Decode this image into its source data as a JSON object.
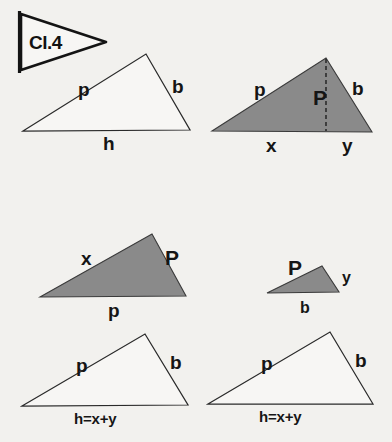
{
  "page": {
    "background_color": "#f2f1ee",
    "width": 392,
    "height": 442
  },
  "flag": {
    "name": "class-flag",
    "label": "Cl.4",
    "pole_color": "#141414",
    "pennant_fill": "#f7f6f4"
  },
  "colors": {
    "ink": "#1a1a1a",
    "shaded_fill": "#8a8a8a",
    "open_fill": "#f7f6f4",
    "paper": "#f2f1ee"
  },
  "figures": [
    {
      "id": "top-left-triangle",
      "name": "triangle-open-top-left",
      "shaded": false,
      "vertices": [
        [
          23,
          131
        ],
        [
          146,
          54
        ],
        [
          190,
          130
        ]
      ],
      "labels": [
        {
          "name": "side-label-p",
          "text": "p",
          "x": 78,
          "y": 96,
          "size": "lbl-lg"
        },
        {
          "name": "side-label-b",
          "text": "b",
          "x": 172,
          "y": 93,
          "size": "lbl-lg"
        },
        {
          "name": "base-label-h",
          "text": "h",
          "x": 103,
          "y": 150,
          "size": "lbl-lg"
        }
      ]
    },
    {
      "id": "top-right-triangle",
      "name": "triangle-shaded-top-right",
      "shaded": true,
      "vertices": [
        [
          212,
          131
        ],
        [
          326,
          58
        ],
        [
          372,
          132
        ]
      ],
      "altitude": {
        "name": "altitude-dashed-line",
        "from": [
          326,
          58
        ],
        "to": [
          326,
          131
        ]
      },
      "labels": [
        {
          "name": "side-label-p",
          "text": "p",
          "x": 254,
          "y": 96,
          "size": "lbl-lg"
        },
        {
          "name": "side-label-b",
          "text": "b",
          "x": 352,
          "y": 95,
          "size": "lbl-lg"
        },
        {
          "name": "altitude-label-P",
          "text": "P",
          "x": 313,
          "y": 105,
          "size": "lbl-xl"
        },
        {
          "name": "base-label-x",
          "text": "x",
          "x": 266,
          "y": 152,
          "size": "lbl-lg"
        },
        {
          "name": "base-label-y",
          "text": "y",
          "x": 342,
          "y": 152,
          "size": "lbl-lg"
        }
      ]
    },
    {
      "id": "mid-left-triangle",
      "name": "triangle-shaded-mid-left",
      "shaded": true,
      "vertices": [
        [
          40,
          297
        ],
        [
          152,
          234
        ],
        [
          186,
          296
        ]
      ],
      "labels": [
        {
          "name": "side-label-x",
          "text": "x",
          "x": 81,
          "y": 265,
          "size": "lbl-lg"
        },
        {
          "name": "side-label-P",
          "text": "P",
          "x": 165,
          "y": 265,
          "size": "lbl-xl"
        },
        {
          "name": "base-label-p",
          "text": "p",
          "x": 108,
          "y": 317,
          "size": "lbl-lg"
        }
      ]
    },
    {
      "id": "mid-right-triangle",
      "name": "triangle-shaded-mid-right",
      "shaded": true,
      "vertices": [
        [
          267,
          293
        ],
        [
          322,
          266
        ],
        [
          339,
          292
        ]
      ],
      "labels": [
        {
          "name": "side-label-P",
          "text": "P",
          "x": 288,
          "y": 275,
          "size": "lbl-xl"
        },
        {
          "name": "side-label-y",
          "text": "y",
          "x": 342,
          "y": 283,
          "size": "lbl-md"
        },
        {
          "name": "base-label-b",
          "text": "b",
          "x": 300,
          "y": 313,
          "size": "lbl-md"
        }
      ]
    },
    {
      "id": "bottom-left-triangle",
      "name": "triangle-open-bottom-left",
      "shaded": false,
      "vertices": [
        [
          22,
          406
        ],
        [
          145,
          334
        ],
        [
          188,
          405
        ]
      ],
      "labels": [
        {
          "name": "side-label-p",
          "text": "p",
          "x": 76,
          "y": 372,
          "size": "lbl-lg"
        },
        {
          "name": "side-label-b",
          "text": "b",
          "x": 170,
          "y": 369,
          "size": "lbl-lg"
        },
        {
          "name": "base-label-sum",
          "text": "h=x+y",
          "x": 74,
          "y": 424,
          "size": "lbl-eq"
        }
      ]
    },
    {
      "id": "bottom-right-triangle",
      "name": "triangle-open-bottom-right",
      "shaded": false,
      "vertices": [
        [
          208,
          404
        ],
        [
          330,
          332
        ],
        [
          373,
          404
        ]
      ],
      "labels": [
        {
          "name": "side-label-p",
          "text": "p",
          "x": 261,
          "y": 370,
          "size": "lbl-lg"
        },
        {
          "name": "side-label-b",
          "text": "b",
          "x": 355,
          "y": 367,
          "size": "lbl-lg"
        },
        {
          "name": "base-label-sum",
          "text": "h=x+y",
          "x": 259,
          "y": 422,
          "size": "lbl-eq"
        }
      ]
    }
  ]
}
